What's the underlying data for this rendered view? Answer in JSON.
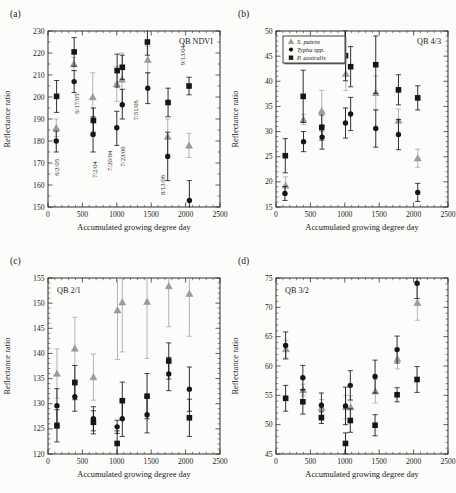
{
  "figure": {
    "bg": "#fcfcfa",
    "axis_color": "#1a1a1a",
    "text_color": "#1a1a1a",
    "gray_marker_color": "#9c9c9c",
    "gray_bar_color": "#ababab",
    "black_color": "#161616"
  },
  "chart_data": [
    {
      "id": "a",
      "type": "scatter",
      "panel_label": "(a)",
      "corner_label": "QB NDVI",
      "corner_side": "right",
      "xlabel": "Accumulated growing degree day",
      "ylabel": "Reflectance ratio",
      "xlim": [
        0,
        2500
      ],
      "xticks": [
        0,
        500,
        1000,
        1500,
        2000,
        2500
      ],
      "xminor": 100,
      "ylim": [
        150,
        230
      ],
      "yticks": [
        150,
        160,
        170,
        180,
        190,
        200,
        210,
        220,
        230
      ],
      "yminor": 5,
      "legend": null,
      "annotations": [
        {
          "text": "6/2/05",
          "x": 155,
          "y": 168
        },
        {
          "text": "6/17/05",
          "x": 450,
          "y": 197
        },
        {
          "text": "7/2/04",
          "x": 710,
          "y": 167
        },
        {
          "text": "7/20/04",
          "x": 925,
          "y": 171
        },
        {
          "text": "7/23/06",
          "x": 1120,
          "y": 173
        },
        {
          "text": "7/31/06",
          "x": 1310,
          "y": 194
        },
        {
          "text": "8/13/06",
          "x": 1700,
          "y": 160
        },
        {
          "text": "9/13/04",
          "x": 1985,
          "y": 219
        }
      ],
      "series": [
        {
          "name": "S. patens",
          "marker": "triangle",
          "color": "gray",
          "points": [
            [
              120,
              186,
              182,
              190
            ],
            [
              375,
              215,
              212,
              218
            ],
            [
              650,
              200,
              189,
              211
            ],
            [
              1000,
              206,
              198,
              214
            ],
            [
              1075,
              208,
              196,
              220
            ],
            [
              1450,
              217,
              211,
              223
            ],
            [
              1740,
              182,
              174,
              190
            ],
            [
              2050,
              178,
              172.5,
              183.5
            ]
          ]
        },
        {
          "name": "Typha spp.",
          "marker": "circle",
          "color": "black",
          "points": [
            [
              120,
              180,
              175,
              184.5
            ],
            [
              380,
              207,
              202,
              212
            ],
            [
              655,
              183,
              175,
              191
            ],
            [
              1000,
              186,
              178,
              193.5
            ],
            [
              1080,
              196.5,
              190,
              203.5
            ],
            [
              1450,
              204,
              197,
              211
            ],
            [
              1740,
              173,
              162,
              184
            ],
            [
              2055,
              153,
              144,
              162
            ]
          ]
        },
        {
          "name": "P. australis",
          "marker": "square",
          "color": "black",
          "points": [
            [
              125,
              200.3,
              193,
              207.5
            ],
            [
              380,
              220.5,
              214,
              227
            ],
            [
              660,
              189.3,
              184,
              195
            ],
            [
              1005,
              212,
              204.5,
              219.5
            ],
            [
              1080,
              213.5,
              208,
              219
            ],
            [
              1445,
              225,
              219,
              231
            ],
            [
              1745,
              197.5,
              191,
              204
            ],
            [
              2050,
              205,
              201,
              209
            ]
          ]
        }
      ]
    },
    {
      "id": "b",
      "type": "scatter",
      "panel_label": "(b)",
      "corner_label": "QB 4/3",
      "corner_side": "right",
      "xlabel": "Accumulated growing degree day",
      "ylabel": "Reflectance ratio",
      "xlim": [
        0,
        2500
      ],
      "xticks": [
        0,
        500,
        1000,
        1500,
        2000,
        2500
      ],
      "xminor": 100,
      "ylim": [
        15,
        50
      ],
      "yticks": [
        15,
        20,
        25,
        30,
        35,
        40,
        45,
        50
      ],
      "yminor": 1,
      "legend": {
        "items": [
          {
            "label": "S. patens",
            "marker": "triangle",
            "color": "gray"
          },
          {
            "label": "Typha spp.",
            "marker": "circle",
            "color": "black"
          },
          {
            "label": "P. australis",
            "marker": "square",
            "color": "black"
          }
        ]
      },
      "annotations": [],
      "series": [
        {
          "name": "S. patens",
          "marker": "triangle",
          "color": "gray",
          "points": [
            [
              140,
              19.3,
              17.6,
              21.0
            ],
            [
              400,
              32.4,
              31.4,
              33.4
            ],
            [
              665,
              34.1,
              30.0,
              38.2
            ],
            [
              1015,
              41.5,
              38.2,
              44.8
            ],
            [
              1450,
              37.7,
              34.3,
              41.1
            ],
            [
              1780,
              32.2,
              29.9,
              34.5
            ],
            [
              2060,
              24.7,
              22.9,
              26.5
            ]
          ]
        },
        {
          "name": "Typha spp.",
          "marker": "circle",
          "color": "black",
          "points": [
            [
              130,
              17.7,
              16.3,
              19.1
            ],
            [
              400,
              28.0,
              26.0,
              30.0
            ],
            [
              670,
              28.9,
              26.5,
              31.3
            ],
            [
              1010,
              31.7,
              28.7,
              34.7
            ],
            [
              1085,
              33.5,
              30.2,
              36.8
            ],
            [
              1450,
              30.6,
              26.9,
              34.3
            ],
            [
              1780,
              29.4,
              26.4,
              32.4
            ],
            [
              2060,
              17.9,
              16.1,
              19.7
            ]
          ]
        },
        {
          "name": "P. australis",
          "marker": "square",
          "color": "black",
          "points": [
            [
              135,
              25.2,
              21.8,
              28.6
            ],
            [
              395,
              37.0,
              31.8,
              42.2
            ],
            [
              665,
              30.8,
              28.3,
              33.3
            ],
            [
              1010,
              45.1,
              40.1,
              50.1
            ],
            [
              1085,
              42.9,
              38.9,
              46.9
            ],
            [
              1450,
              43.3,
              37.6,
              49.0
            ],
            [
              1780,
              38.3,
              35.3,
              41.3
            ],
            [
              2060,
              36.7,
              34.3,
              39.1
            ]
          ]
        }
      ]
    },
    {
      "id": "c",
      "type": "scatter",
      "panel_label": "(c)",
      "corner_label": "QB 2/1",
      "corner_side": "left",
      "xlabel": "Accumulated growing degree day",
      "ylabel": "Reflectance ratio",
      "xlim": [
        0,
        2500
      ],
      "xticks": [
        0,
        500,
        1000,
        1500,
        2000,
        2500
      ],
      "xminor": 100,
      "ylim": [
        120,
        155
      ],
      "yticks": [
        120,
        125,
        130,
        135,
        140,
        145,
        150,
        155
      ],
      "yminor": 1,
      "legend": null,
      "annotations": [],
      "series": [
        {
          "name": "S. patens",
          "marker": "triangle",
          "color": "gray",
          "points": [
            [
              130,
              136.0,
              131.1,
              140.9
            ],
            [
              390,
              141.0,
              134.8,
              147.2
            ],
            [
              660,
              135.3,
              130.7,
              139.9
            ],
            [
              1010,
              148.6,
              138.8,
              157
            ],
            [
              1080,
              150.2,
              140.3,
              158
            ],
            [
              1440,
              150.3,
              139.0,
              160
            ],
            [
              1755,
              153.4,
              145.3,
              161
            ],
            [
              2055,
              151.9,
              143.4,
              160
            ]
          ]
        },
        {
          "name": "Typha spp.",
          "marker": "circle",
          "color": "black",
          "points": [
            [
              130,
              129.6,
              126.2,
              133.0
            ],
            [
              390,
              131.4,
              128.5,
              134.3
            ],
            [
              660,
              127.0,
              124.6,
              129.4
            ],
            [
              1005,
              125.4,
              124.1,
              126.7
            ],
            [
              1080,
              127.0,
              123.5,
              130.5
            ],
            [
              1440,
              127.8,
              124.2,
              131.4
            ],
            [
              1755,
              135.9,
              132.6,
              139.2
            ],
            [
              2055,
              132.9,
              128.5,
              137.3
            ]
          ]
        },
        {
          "name": "P. australis",
          "marker": "square",
          "color": "black",
          "points": [
            [
              130,
              125.6,
              122.4,
              128.8
            ],
            [
              390,
              134.2,
              130.8,
              137.6
            ],
            [
              660,
              126.3,
              124.0,
              128.6
            ],
            [
              1005,
              122.1,
              119.6,
              124.6
            ],
            [
              1080,
              130.6,
              126.9,
              134.3
            ],
            [
              1440,
              131.5,
              127.0,
              136.0
            ],
            [
              1755,
              138.5,
              134.9,
              142.1
            ],
            [
              2055,
              127.2,
              123.5,
              130.9
            ]
          ]
        }
      ]
    },
    {
      "id": "d",
      "type": "scatter",
      "panel_label": "(d)",
      "corner_label": "QB 3/2",
      "corner_side": "left",
      "xlabel": "Accumulated growing degree day",
      "ylabel": "Reflectance ratio",
      "xlim": [
        0,
        2500
      ],
      "xticks": [
        0,
        500,
        1000,
        1500,
        2000,
        2500
      ],
      "xminor": 100,
      "ylim": [
        45,
        75
      ],
      "yticks": [
        45,
        50,
        55,
        60,
        65,
        70,
        75
      ],
      "yminor": 1,
      "legend": null,
      "annotations": [],
      "series": [
        {
          "name": "S. patens",
          "marker": "triangle",
          "color": "gray",
          "points": [
            [
              145,
              62.9,
              61.4,
              64.4
            ],
            [
              395,
              55.9,
              54.9,
              56.9
            ],
            [
              665,
              52.9,
              51.5,
              54.3
            ],
            [
              1015,
              53.0,
              51.0,
              55.0
            ],
            [
              1085,
              53.0,
              51.1,
              54.9
            ],
            [
              1445,
              55.7,
              53.7,
              57.7
            ],
            [
              1765,
              61.2,
              59.5,
              62.9
            ],
            [
              2055,
              70.8,
              67.8,
              73.8
            ]
          ]
        },
        {
          "name": "Typha spp.",
          "marker": "circle",
          "color": "black",
          "points": [
            [
              140,
              63.5,
              61.2,
              65.8
            ],
            [
              390,
              58.0,
              55.9,
              60.1
            ],
            [
              660,
              53.3,
              51.2,
              55.4
            ],
            [
              1010,
              53.2,
              50.0,
              56.4
            ],
            [
              1080,
              56.7,
              54.2,
              59.2
            ],
            [
              1440,
              58.2,
              55.4,
              61.0
            ],
            [
              1760,
              62.8,
              60.5,
              65.1
            ],
            [
              2050,
              74.1,
              71.5,
              76.7
            ]
          ]
        },
        {
          "name": "P. australis",
          "marker": "square",
          "color": "black",
          "points": [
            [
              140,
              54.5,
              52.3,
              56.7
            ],
            [
              390,
              53.9,
              51.8,
              56.0
            ],
            [
              660,
              51.2,
              50.2,
              52.2
            ],
            [
              1010,
              46.8,
              45.0,
              48.6
            ],
            [
              1080,
              50.7,
              48.7,
              52.7
            ],
            [
              1440,
              49.9,
              48.1,
              51.7
            ],
            [
              1760,
              55.1,
              53.9,
              56.3
            ],
            [
              2050,
              57.7,
              55.5,
              59.9
            ]
          ]
        }
      ]
    }
  ]
}
